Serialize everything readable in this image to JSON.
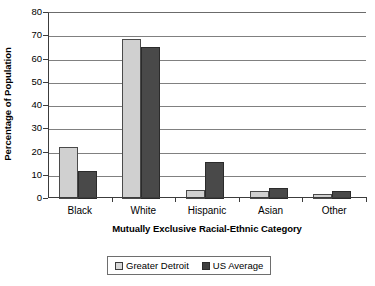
{
  "chart_data": {
    "type": "bar",
    "title": "",
    "xlabel": "Mutually Exclusive Racial-Ethnic Category",
    "ylabel": "Percentage of Population",
    "categories": [
      "Black",
      "White",
      "Hispanic",
      "Asian",
      "Other"
    ],
    "series": [
      {
        "name": "Greater Detroit",
        "color": "#d0d0d0",
        "values": [
          22.5,
          69,
          4,
          3.5,
          2
        ]
      },
      {
        "name": "US Average",
        "color": "#494949",
        "values": [
          12,
          65.5,
          16,
          4.8,
          3.3
        ]
      }
    ],
    "ylim": [
      0,
      80
    ],
    "yticks": [
      0,
      10,
      20,
      30,
      40,
      50,
      60,
      70,
      80
    ],
    "ytick_labels": [
      "0",
      "10",
      "20",
      "30",
      "40",
      "50",
      "60",
      "70",
      "80"
    ],
    "grid": "horizontal",
    "legend_position": "bottom-center"
  },
  "legend": {
    "entries": [
      {
        "label": "Greater Detroit",
        "swatch": "light-gray-square"
      },
      {
        "label": "US Average",
        "swatch": "dark-gray-square"
      }
    ]
  }
}
